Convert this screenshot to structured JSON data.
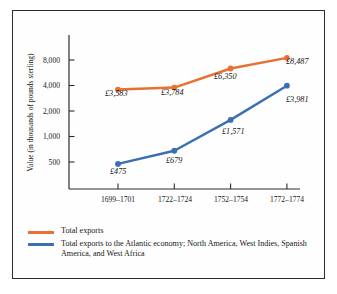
{
  "chart_data": {
    "type": "line",
    "title": "",
    "xlabel": "",
    "ylabel": "Value (in thousands of pounds sterling)",
    "yscale": "log",
    "ylim": [
      400,
      10000
    ],
    "yticks": [
      500,
      1000,
      2000,
      4000,
      8000
    ],
    "ytick_labels": [
      "500",
      "1,000",
      "2,000",
      "4,000",
      "8,000"
    ],
    "grid": false,
    "legend_position": "below",
    "categories": [
      "1699–1701",
      "1722–1724",
      "1752–1754",
      "1772–1774"
    ],
    "series": [
      {
        "name": "Total exports",
        "color": "#E8712F",
        "values": [
          3583,
          3784,
          6350,
          8487
        ],
        "point_labels": [
          "£3,583",
          "£3,784",
          "£6,350",
          "£8,487"
        ]
      },
      {
        "name": "Total exports to the Atlantic economy; North America, West Indies, Spanish America, and West Africa",
        "color": "#3A6FB5",
        "values": [
          475,
          679,
          1571,
          3981
        ],
        "point_labels": [
          "£475",
          "£679",
          "£1,571",
          "£3,981"
        ]
      }
    ]
  },
  "legend": {
    "entries": [
      {
        "label": "Total exports",
        "color": "#E8712F"
      },
      {
        "label": "Total exports to the Atlantic economy; North America, West Indies, Spanish America, and West Africa",
        "color": "#3A6FB5"
      }
    ]
  },
  "axis": {
    "y_title": "Value (in thousands of pounds sterling)",
    "y_tick_labels": [
      "8,000",
      "4,000",
      "2,000",
      "1,000",
      "500"
    ],
    "x_tick_labels": [
      "1699–1701",
      "1722–1724",
      "1752–1754",
      "1772–1774"
    ]
  },
  "colors": {
    "series_orange": "#E8712F",
    "series_blue": "#3A6FB5",
    "axis": "#2b2b2b",
    "frame": "#2b2b2b",
    "background": "#ffffff"
  }
}
